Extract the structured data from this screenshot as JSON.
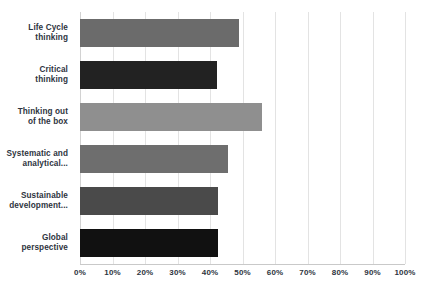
{
  "chart_data": {
    "type": "bar",
    "orientation": "horizontal",
    "title": "",
    "subtitle": "",
    "xlabel": "",
    "ylabel": "",
    "xlim": [
      0,
      100
    ],
    "grid": true,
    "legend": false,
    "legend_position": "none",
    "value_unit": "%",
    "categories": [
      "Life Cycle\nthinking",
      "Critical\nthinking",
      "Thinking out\nof the box",
      "Systematic and\nanalytical...",
      "Sustainable\ndevelopment...",
      "Global\nperspective"
    ],
    "values": [
      49,
      42,
      56,
      45.5,
      42.5,
      42.5
    ],
    "bar_colors": [
      "#6b6b6b",
      "#222222",
      "#8f8f8f",
      "#6e6e6e",
      "#4a4a4a",
      "#111111"
    ],
    "xticks": [
      0,
      10,
      20,
      30,
      40,
      50,
      60,
      70,
      80,
      90,
      100
    ],
    "xticklabels": [
      "0%",
      "10%",
      "20%",
      "30%",
      "40%",
      "50%",
      "60%",
      "70%",
      "80%",
      "90%",
      "100%"
    ],
    "gridline_color": "#e3e3e3",
    "axis_line_color": "#c9c9c9",
    "label_color": "#2e3440",
    "background_color": "#ffffff"
  }
}
